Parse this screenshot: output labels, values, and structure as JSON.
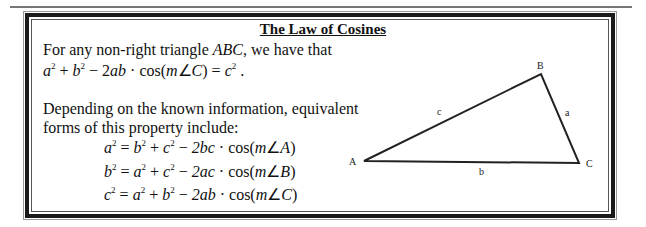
{
  "document": {
    "title": "The Law of Cosines",
    "intro": {
      "line1_prefix": "For any non-right triangle ",
      "triangle_name": "ABC",
      "line1_suffix": ", we have that",
      "formula": "a² + b² − 2ab·cos(m∠C) = c² ."
    },
    "forms_intro": {
      "line1": "Depending on the known information, equivalent",
      "line2": "forms of this property include:"
    },
    "equations": [
      {
        "lhs": "a",
        "rhs1": "b",
        "rhs2": "c",
        "coef": "2bc",
        "angle": "A"
      },
      {
        "lhs": "b",
        "rhs1": "a",
        "rhs2": "c",
        "coef": "2ac",
        "angle": "B"
      },
      {
        "lhs": "c",
        "rhs1": "a",
        "rhs2": "b",
        "coef": "2ab",
        "angle": "C"
      }
    ],
    "diagram": {
      "vertices": {
        "A": {
          "label": "A",
          "x": 364,
          "y": 161
        },
        "B": {
          "label": "B",
          "x": 541,
          "y": 74
        },
        "C": {
          "label": "C",
          "x": 579,
          "y": 163
        }
      },
      "sides": {
        "a": {
          "label": "a"
        },
        "b": {
          "label": "b"
        },
        "c": {
          "label": "c"
        }
      }
    }
  }
}
